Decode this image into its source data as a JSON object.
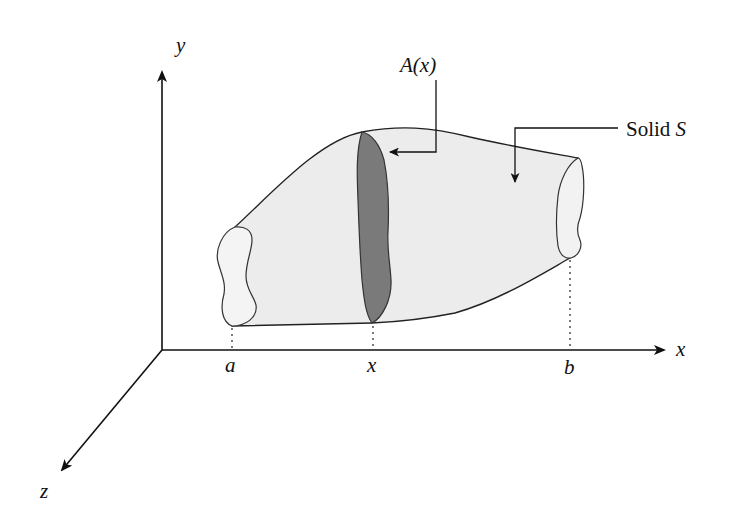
{
  "diagram": {
    "type": "volume-by-cross-sections",
    "axes": {
      "x_label": "x",
      "y_label": "y",
      "z_label": "z"
    },
    "x_ticks": [
      {
        "label": "a"
      },
      {
        "label": "x"
      },
      {
        "label": "b"
      }
    ],
    "annotations": {
      "cross_section_label": "A(x)",
      "solid_label_text": "Solid ",
      "solid_label_var": "S"
    },
    "colors": {
      "solid_fill": "#ececec",
      "cross_section_fill": "#7a7a7a",
      "stroke": "#222222"
    }
  }
}
